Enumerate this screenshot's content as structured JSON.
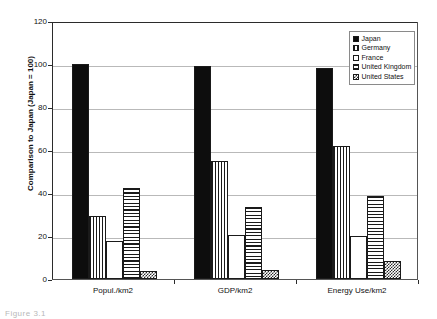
{
  "chart_data": {
    "type": "bar",
    "title": "",
    "subtitle": "",
    "xlabel": "",
    "ylabel": "Comparison to Japan (Japan = 100)",
    "ylim": [
      0,
      120
    ],
    "yticks": [
      0,
      20,
      40,
      60,
      80,
      100,
      120
    ],
    "ytick_labels": [
      "0",
      "20",
      "40",
      "60",
      "80",
      "100",
      "120"
    ],
    "grid": true,
    "legend_position": "top-right",
    "categories": [
      "Popul./km2",
      "GDP/km2",
      "Energy Use/km2"
    ],
    "series": [
      {
        "name": "Japan",
        "pattern": "solid-black",
        "values": [
          100,
          99,
          98
        ]
      },
      {
        "name": "Germany",
        "pattern": "vertical-lines",
        "values": [
          29.5,
          55,
          62
        ]
      },
      {
        "name": "France",
        "pattern": "fine-dots",
        "values": [
          17.5,
          20.5,
          20
        ]
      },
      {
        "name": "United Kingdom",
        "pattern": "horizontal-lines",
        "values": [
          42.5,
          33.5,
          38.5
        ]
      },
      {
        "name": "United States",
        "pattern": "checkerboard",
        "values": [
          3.5,
          4,
          8.5
        ]
      }
    ]
  },
  "legend": {
    "entries": [
      {
        "label": "Japan"
      },
      {
        "label": "Germany"
      },
      {
        "label": "France"
      },
      {
        "label": "United Kingdom"
      },
      {
        "label": "United States"
      }
    ]
  },
  "caption": {
    "text": "Figure 3.1"
  },
  "colors": {
    "axis": "#2b2b2b",
    "gridline": "#b9b9b9",
    "ink": "#111111",
    "background": "#ffffff"
  }
}
